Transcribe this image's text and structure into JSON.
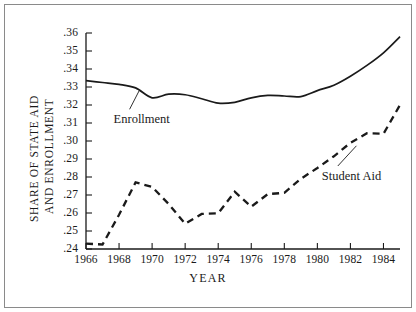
{
  "chart_data": {
    "type": "line",
    "title": "",
    "xlabel": "YEAR",
    "ylabel_line1": "SHARE OF STATE AID",
    "ylabel_line2": "AND ENROLLMENT",
    "xlim": [
      1966,
      1985
    ],
    "ylim": [
      0.24,
      0.36
    ],
    "grid": false,
    "legend_position": "inline-annotations",
    "xticks": [
      1966,
      1968,
      1970,
      1972,
      1974,
      1976,
      1978,
      1980,
      1982,
      1984
    ],
    "xtick_labels": [
      "1966",
      "1968",
      "1970",
      "1972",
      "1974",
      "1976",
      "1978",
      "1980",
      "1982",
      "1984"
    ],
    "yticks": [
      0.24,
      0.25,
      0.26,
      0.27,
      0.28,
      0.29,
      0.3,
      0.31,
      0.32,
      0.33,
      0.34,
      0.35,
      0.36
    ],
    "ytick_labels": [
      ".24",
      ".25",
      ".26",
      ".27",
      ".28",
      ".29",
      ".30",
      ".31",
      ".32",
      ".33",
      ".34",
      ".35",
      ".36"
    ],
    "x": [
      1966,
      1967,
      1968,
      1969,
      1970,
      1971,
      1972,
      1973,
      1974,
      1975,
      1976,
      1977,
      1978,
      1979,
      1980,
      1981,
      1982,
      1983,
      1984,
      1985
    ],
    "series": [
      {
        "name": "Enrollment",
        "style": "solid",
        "color": "#1a1a1a",
        "values": [
          0.3335,
          0.3325,
          0.3315,
          0.3295,
          0.324,
          0.326,
          0.3257,
          0.3235,
          0.321,
          0.3215,
          0.324,
          0.3253,
          0.325,
          0.3247,
          0.328,
          0.331,
          0.336,
          0.342,
          0.349,
          0.358
        ]
      },
      {
        "name": "Student Aid",
        "style": "dashed",
        "color": "#1a1a1a",
        "values": [
          0.243,
          0.2425,
          0.259,
          0.277,
          0.2745,
          0.265,
          0.254,
          0.2595,
          0.2598,
          0.2718,
          0.2635,
          0.2705,
          0.2712,
          0.279,
          0.285,
          0.2915,
          0.299,
          0.3043,
          0.304,
          0.32
        ]
      }
    ],
    "annotations": [
      {
        "name": "Enrollment",
        "label": "Enrollment",
        "x": 1969.0,
        "y": 0.3115
      },
      {
        "name": "Student Aid",
        "label": "Student Aid",
        "x": 1981.6,
        "y": 0.28
      }
    ]
  }
}
